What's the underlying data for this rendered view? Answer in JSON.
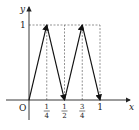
{
  "chart_data": {
    "type": "line",
    "title": "",
    "xlabel": "x",
    "ylabel": "y",
    "origin_label": "O",
    "xlim": [
      0,
      1
    ],
    "ylim": [
      0,
      1
    ],
    "series": [
      {
        "name": "zigzag",
        "x": [
          0,
          0.25,
          0.5,
          0.75,
          1
        ],
        "y": [
          0,
          1,
          0,
          1,
          0
        ]
      }
    ],
    "x_ticks": [
      {
        "value": 0.25,
        "num": "1",
        "den": "4"
      },
      {
        "value": 0.5,
        "num": "1",
        "den": "2"
      },
      {
        "value": 0.75,
        "num": "3",
        "den": "4"
      },
      {
        "value": 1,
        "label": "1"
      }
    ],
    "y_ticks": [
      {
        "value": 1,
        "label": "1"
      }
    ],
    "guides": "dashed",
    "arrows_on_segments": true
  }
}
